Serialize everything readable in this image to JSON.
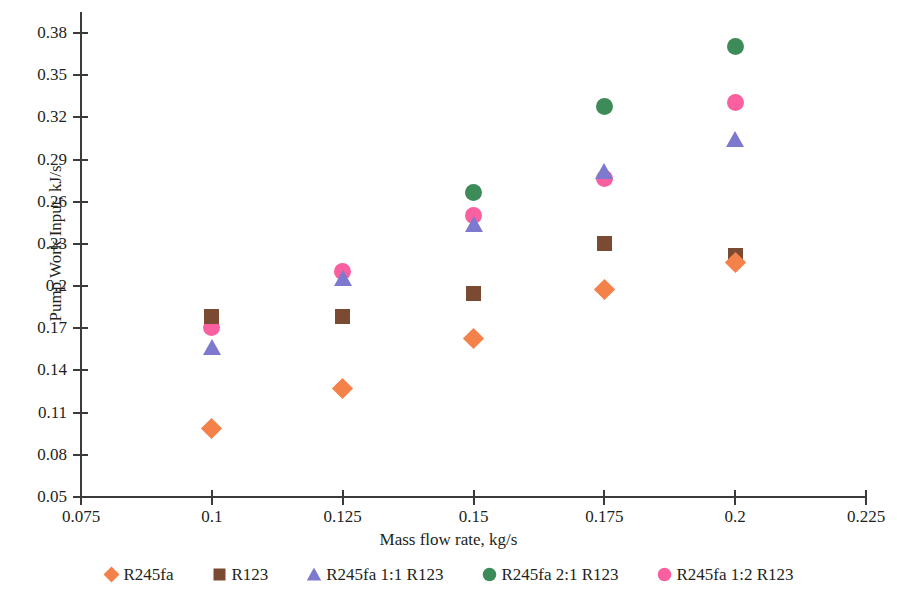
{
  "chart_data": {
    "type": "scatter",
    "title": "",
    "xlabel": "Mass flow rate, kg/s",
    "ylabel": "Pump Work Input, kJ/s",
    "xlim": [
      0.075,
      0.225
    ],
    "ylim": [
      0.05,
      0.38
    ],
    "xticks": [
      "0.075",
      "0.1",
      "0.125",
      "0.15",
      "0.175",
      "0.2",
      "0.225"
    ],
    "xtick_values": [
      0.075,
      0.1,
      0.125,
      0.15,
      0.175,
      0.2,
      0.225
    ],
    "yticks": [
      "0.05",
      "0.08",
      "0.11",
      "0.14",
      "0.17",
      "0.2",
      "0.23",
      "0.26",
      "0.29",
      "0.32",
      "0.35",
      "0.38"
    ],
    "ytick_values": [
      0.05,
      0.08,
      0.11,
      0.14,
      0.17,
      0.2,
      0.23,
      0.26,
      0.29,
      0.32,
      0.35,
      0.38
    ],
    "grid": false,
    "legend_position": "bottom",
    "x": [
      0.1,
      0.125,
      0.15,
      0.175,
      0.2
    ],
    "series": [
      {
        "name": "R245fa",
        "marker": "diamond",
        "color": "#f4814a",
        "values": [
          0.0985,
          0.1275,
          0.1625,
          0.1975,
          0.2165
        ]
      },
      {
        "name": "R123",
        "marker": "square",
        "color": "#7b4a32",
        "values": [
          0.1785,
          0.1785,
          0.1945,
          0.2305,
          0.2215
        ]
      },
      {
        "name": "R245fa 1:1 R123",
        "marker": "triangle",
        "color": "#7c79cf",
        "values": [
          0.1565,
          0.2055,
          0.2445,
          0.2815,
          0.3045
        ]
      },
      {
        "name": "R245fa 2:1 R123",
        "marker": "circle",
        "color": "#3e8b5a",
        "values": [
          null,
          null,
          0.2665,
          0.3275,
          0.3705
        ]
      },
      {
        "name": "R245fa 1:2 R123",
        "marker": "circle",
        "color": "#fa5fa0",
        "values": [
          0.1705,
          0.2105,
          0.2505,
          0.2765,
          0.3305
        ]
      }
    ]
  }
}
